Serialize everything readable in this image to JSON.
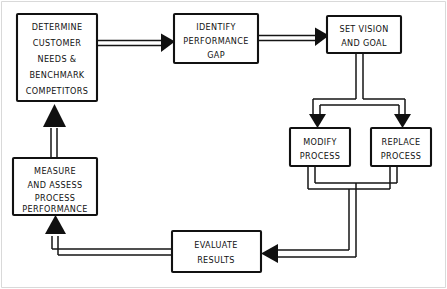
{
  "diagram": {
    "style": "hand-drawn flowchart",
    "background_color": "#ffffff",
    "ink_color": "#111111",
    "border_color": "#d9d9d9"
  },
  "nodes": [
    {
      "id": "determine",
      "name": "determine-customer-needs-box",
      "lines": [
        "DETERMINE",
        "CUSTOMER",
        "NEEDS &",
        "BENCHMARK",
        "COMPETITORS"
      ],
      "x": 17,
      "y": 14,
      "w": 80,
      "h": 87
    },
    {
      "id": "identify",
      "name": "identify-performance-gap-box",
      "lines": [
        "IDENTIFY",
        "PERFORMANCE",
        "GAP"
      ],
      "x": 174,
      "y": 14,
      "w": 84,
      "h": 49
    },
    {
      "id": "vision",
      "name": "set-vision-and-goal-box",
      "lines": [
        "SET VISION",
        "AND GOAL"
      ],
      "x": 327,
      "y": 16,
      "w": 74,
      "h": 37
    },
    {
      "id": "modify",
      "name": "modify-process-box",
      "lines": [
        "MODIFY",
        "PROCESS"
      ],
      "x": 290,
      "y": 128,
      "w": 60,
      "h": 38
    },
    {
      "id": "replace",
      "name": "replace-process-box",
      "lines": [
        "REPLACE",
        "PROCESS"
      ],
      "x": 371,
      "y": 128,
      "w": 60,
      "h": 38
    },
    {
      "id": "measure",
      "name": "measure-and-assess-box",
      "lines": [
        "MEASURE",
        "AND ASSESS",
        "PROCESS",
        "PERFORMANCE"
      ],
      "x": 13,
      "y": 158,
      "w": 84,
      "h": 57
    },
    {
      "id": "evaluate",
      "name": "evaluate-results-box",
      "lines": [
        "EVALUATE",
        "RESULTS"
      ],
      "x": 172,
      "y": 231,
      "w": 89,
      "h": 41
    }
  ],
  "edges": [
    {
      "name": "edge-determine-to-identify",
      "from": "determine",
      "to": "identify",
      "direction": "right"
    },
    {
      "name": "edge-identify-to-vision",
      "from": "identify",
      "to": "vision",
      "direction": "right"
    },
    {
      "name": "edge-vision-to-modify",
      "from": "vision",
      "to": "modify",
      "direction": "down-left"
    },
    {
      "name": "edge-vision-to-replace",
      "from": "vision",
      "to": "replace",
      "direction": "down-right"
    },
    {
      "name": "edge-modify-to-evaluate",
      "from": "modify",
      "to": "evaluate",
      "direction": "down-left"
    },
    {
      "name": "edge-replace-to-evaluate",
      "from": "replace",
      "to": "evaluate",
      "direction": "down-left"
    },
    {
      "name": "edge-evaluate-to-measure",
      "from": "evaluate",
      "to": "measure",
      "direction": "left-up"
    },
    {
      "name": "edge-measure-to-determine",
      "from": "measure",
      "to": "determine",
      "direction": "up"
    }
  ]
}
